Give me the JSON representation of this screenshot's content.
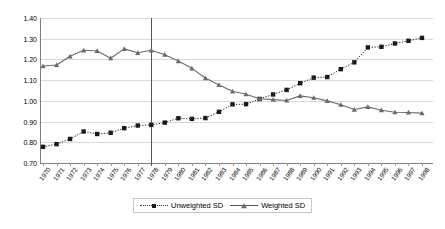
{
  "chart_data": {
    "type": "line",
    "title": "",
    "subtitle": "",
    "xlabel": "",
    "ylabel": "",
    "ylim": [
      0.7,
      1.4
    ],
    "ytick_step": 0.1,
    "yticks": [
      "0.70",
      "0.80",
      "0.90",
      "1.00",
      "1.10",
      "1.20",
      "1.30",
      "1.40"
    ],
    "grid": true,
    "legend_position": "bottom-center",
    "x": [
      "1970",
      "1971",
      "1972",
      "1973",
      "1974",
      "1975",
      "1976",
      "1977",
      "1978",
      "1979",
      "1980",
      "1981",
      "1982",
      "1983",
      "1984",
      "1985",
      "1986",
      "1987",
      "1988",
      "1989",
      "1990",
      "1991",
      "1992",
      "1993",
      "1994",
      "1995",
      "1996",
      "1997",
      "1998"
    ],
    "annotations": [
      {
        "name": "vertical-reference-line",
        "type": "vline",
        "x": "1978",
        "color": "#555555"
      }
    ],
    "series": [
      {
        "name": "Unweighted SD",
        "marker": "square",
        "line_style": "dotted",
        "color": "#1a1a1a",
        "values": [
          0.778,
          0.791,
          0.816,
          0.852,
          0.84,
          0.846,
          0.868,
          0.881,
          0.884,
          0.895,
          0.916,
          0.913,
          0.917,
          0.947,
          0.983,
          0.984,
          1.009,
          1.031,
          1.053,
          1.085,
          1.112,
          1.115,
          1.153,
          1.186,
          1.258,
          1.261,
          1.277,
          1.29,
          1.304
        ]
      },
      {
        "name": "Weighted SD",
        "marker": "triangle",
        "line_style": "solid",
        "color": "#6b6b6b",
        "values": [
          1.168,
          1.173,
          1.215,
          1.244,
          1.241,
          1.206,
          1.251,
          1.232,
          1.244,
          1.223,
          1.192,
          1.157,
          1.11,
          1.077,
          1.046,
          1.032,
          1.01,
          1.006,
          1.002,
          1.024,
          1.015,
          1.0,
          0.981,
          0.958,
          0.971,
          0.955,
          0.945,
          0.944,
          0.941
        ]
      }
    ]
  },
  "legend": {
    "entries": [
      {
        "label": "Unweighted SD"
      },
      {
        "label": "Weighted SD"
      }
    ]
  }
}
